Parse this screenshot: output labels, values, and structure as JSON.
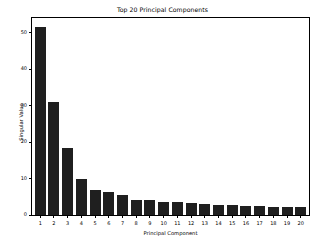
{
  "chart_data": {
    "type": "bar",
    "title": "Top 20 Principal Components",
    "xlabel": "Principal Component",
    "ylabel": "Singular Value",
    "categories": [
      "1",
      "2",
      "3",
      "4",
      "5",
      "6",
      "7",
      "8",
      "9",
      "10",
      "11",
      "12",
      "13",
      "14",
      "15",
      "16",
      "17",
      "18",
      "19",
      "20"
    ],
    "values": [
      51.5,
      31.0,
      18.5,
      10.0,
      6.8,
      6.3,
      5.6,
      4.2,
      4.1,
      3.7,
      3.5,
      3.2,
      3.0,
      2.8,
      2.7,
      2.6,
      2.4,
      2.3,
      2.2,
      2.1
    ],
    "ylim": [
      0,
      54
    ],
    "xlim": [
      0.4,
      20.6
    ],
    "yticks": [
      0,
      10,
      20,
      30,
      40,
      50
    ],
    "ytick_labels": [
      "0",
      "10",
      "20",
      "30",
      "40",
      "50"
    ],
    "grid": false,
    "legend": null,
    "bar_color": "#1f1f1f",
    "background_color": "#ffffff",
    "axis_color": "#000000"
  }
}
